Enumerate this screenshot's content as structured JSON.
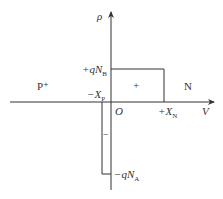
{
  "diagram": {
    "axes": {
      "vertical_label": "ρ",
      "horizontal_label": "V",
      "origin_label": "O"
    },
    "regions": {
      "left": "P⁺",
      "right": "N"
    },
    "levels": {
      "positive": {
        "prefix": "+q",
        "symbol": "N",
        "subscript": "B"
      },
      "negative": {
        "prefix": "−q",
        "symbol": "N",
        "subscript": "A"
      }
    },
    "boundaries": {
      "left": {
        "prefix": "−",
        "symbol": "X",
        "subscript": "P"
      },
      "right": {
        "prefix": "+",
        "symbol": "X",
        "subscript": "N"
      }
    },
    "signs": {
      "positive_block": "+",
      "negative_block": "−"
    },
    "colors": {
      "line": "#333333",
      "text": "#333333",
      "background": "#ffffff"
    }
  }
}
